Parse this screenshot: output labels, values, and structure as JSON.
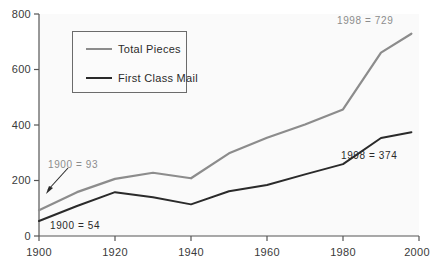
{
  "chart_data": {
    "type": "line",
    "title": "",
    "xlabel": "",
    "ylabel": "",
    "xlim": [
      1900,
      2000
    ],
    "ylim": [
      0,
      800
    ],
    "grid": false,
    "legend_position": "upper-left-inside",
    "x_ticks": [
      "1900",
      "1920",
      "1940",
      "1960",
      "1980",
      "2000"
    ],
    "x_tick_values": [
      1900,
      1920,
      1940,
      1960,
      1980,
      2000
    ],
    "y_ticks": [
      "0",
      "200",
      "400",
      "600",
      "800"
    ],
    "y_tick_values": [
      0,
      200,
      400,
      600,
      800
    ],
    "x": [
      1900,
      1910,
      1920,
      1930,
      1940,
      1950,
      1960,
      1970,
      1980,
      1990,
      1998
    ],
    "series": [
      {
        "name": "Total  Pieces",
        "color": "#8c8c8c",
        "width": 2.2,
        "values": [
          93,
          158,
          206,
          228,
          208,
          298,
          354,
          402,
          456,
          661,
          729
        ]
      },
      {
        "name": "First Class Mail",
        "color": "#2a2a2a",
        "width": 2.0,
        "values": [
          54,
          108,
          158,
          140,
          114,
          161,
          184,
          222,
          259,
          353,
          374
        ]
      }
    ],
    "annotations": [
      {
        "id": "total-start",
        "text": "1900  =  93",
        "color": "#8c8c8c",
        "x": 48,
        "y": 159
      },
      {
        "id": "first-start",
        "text": "1900  =  54",
        "color": "#2a2a2a",
        "x": 50,
        "y": 220
      },
      {
        "id": "total-end",
        "text": "1998  =  729",
        "color": "#8c8c8c",
        "x": 337,
        "y": 15
      },
      {
        "id": "first-end",
        "text": "1998  =  374",
        "color": "#2a2a2a",
        "x": 341,
        "y": 150
      }
    ]
  },
  "axes": {
    "axis_color": "#555555",
    "plot_background": "#fafafa",
    "page_background": "#ffffff"
  }
}
